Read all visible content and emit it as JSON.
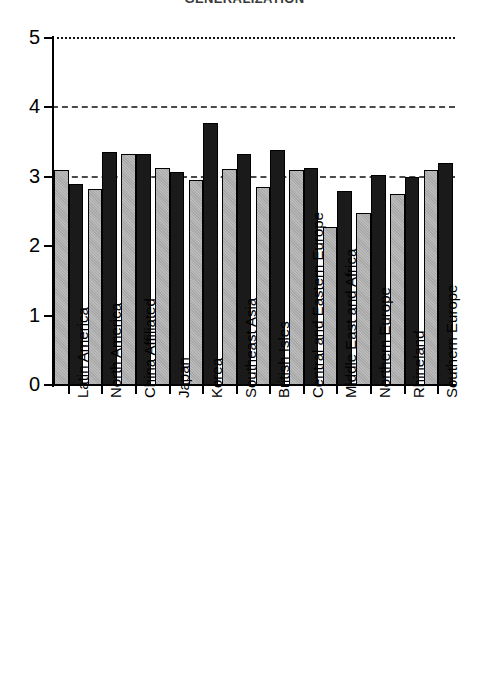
{
  "chart_data": {
    "type": "bar",
    "title": "GENERALIZATION",
    "xlabel": "",
    "ylabel": "",
    "ylim": [
      0,
      5
    ],
    "yticks": [
      0,
      1,
      2,
      3,
      4,
      5
    ],
    "ytick_labels": [
      "0",
      "1",
      "2",
      "3",
      "4",
      "5"
    ],
    "grid": true,
    "gridlines": [
      {
        "value": 5,
        "style": "dotted"
      },
      {
        "value": 4,
        "style": "dashed"
      },
      {
        "value": 3,
        "style": "dashed"
      }
    ],
    "legend": null,
    "legend_position": "none",
    "categories": [
      "Latin America",
      "North America",
      "China Affiliated",
      "Japan",
      "Korea",
      "Southeast Asia",
      "British Isles",
      "Central and Eastern Europe",
      "Middle East and Africa",
      "Northern Europe",
      "Rhineland",
      "Southern Europe"
    ],
    "series": [
      {
        "name": "Series 1",
        "color": "#a8a8a8",
        "values": [
          3.1,
          2.82,
          3.33,
          3.12,
          2.95,
          3.11,
          2.85,
          3.1,
          2.27,
          2.48,
          2.75,
          3.1
        ]
      },
      {
        "name": "Series 2",
        "color": "#1a1a1a",
        "values": [
          2.9,
          3.36,
          3.33,
          3.07,
          3.78,
          3.33,
          3.39,
          3.12,
          2.8,
          3.02,
          3.0,
          3.2
        ]
      }
    ]
  }
}
